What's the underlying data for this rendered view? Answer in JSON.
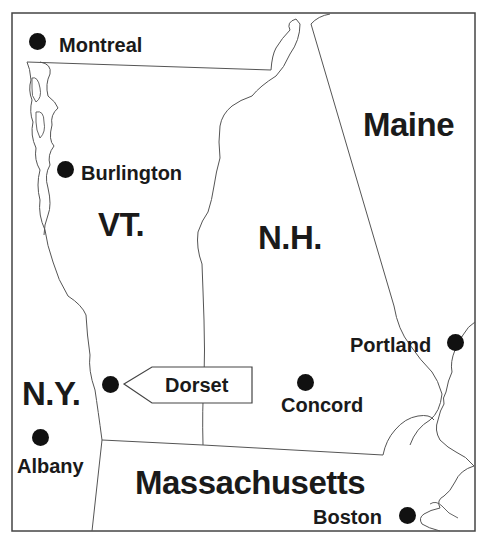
{
  "map": {
    "type": "regional locator map",
    "colors": {
      "ink": "#1a1a1a",
      "border_line": "#555555",
      "background": "#ffffff"
    },
    "states": [
      {
        "id": "vt",
        "label": "VT."
      },
      {
        "id": "nh",
        "label": "N.H."
      },
      {
        "id": "me",
        "label": "Maine"
      },
      {
        "id": "ny",
        "label": "N.Y."
      },
      {
        "id": "ma",
        "label": "Massachusetts"
      }
    ],
    "cities": [
      {
        "id": "montreal",
        "label": "Montreal"
      },
      {
        "id": "burlington",
        "label": "Burlington"
      },
      {
        "id": "portland",
        "label": "Portland"
      },
      {
        "id": "dorset",
        "label": "Dorset",
        "highlighted": true
      },
      {
        "id": "concord",
        "label": "Concord"
      },
      {
        "id": "albany",
        "label": "Albany"
      },
      {
        "id": "boston",
        "label": "Boston"
      }
    ],
    "callout": {
      "target": "Dorset",
      "label": "Dorset"
    }
  }
}
